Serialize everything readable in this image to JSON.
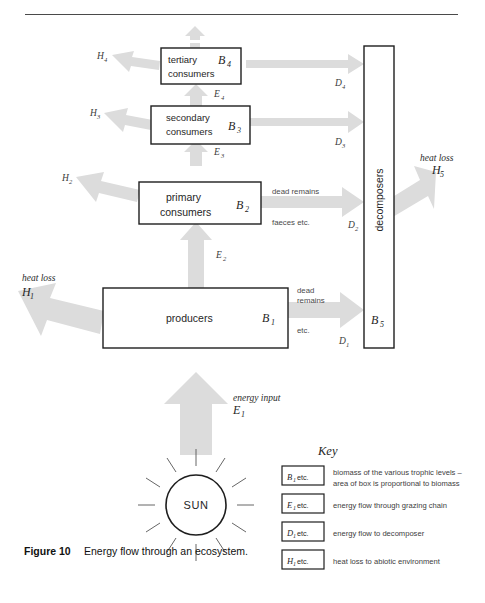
{
  "figure": {
    "caption_number": "Figure 10",
    "caption_text": "Energy flow through an ecosystem."
  },
  "trophic_levels": [
    {
      "id": "tertiary",
      "line1": "tertiary",
      "line2": "consumers",
      "biomass_symbol": "B",
      "biomass_sub": "4",
      "heat_loss_symbol": "H",
      "heat_loss_sub": "4",
      "energy_in_symbol": "E",
      "energy_in_sub": "4",
      "decomposer_symbol": "D",
      "decomposer_sub": "4"
    },
    {
      "id": "secondary",
      "line1": "secondary",
      "line2": "consumers",
      "biomass_symbol": "B",
      "biomass_sub": "3",
      "heat_loss_symbol": "H",
      "heat_loss_sub": "3",
      "energy_in_symbol": "E",
      "energy_in_sub": "3",
      "decomposer_symbol": "D",
      "decomposer_sub": "3"
    },
    {
      "id": "primary",
      "line1": "primary",
      "line2": "consumers",
      "biomass_symbol": "B",
      "biomass_sub": "2",
      "heat_loss_symbol": "H",
      "heat_loss_sub": "2",
      "energy_in_symbol": "E",
      "energy_in_sub": "2",
      "decomposer_symbol": "D",
      "decomposer_sub": "2",
      "transfer_note_1": "dead remains",
      "transfer_note_2": "faeces etc."
    },
    {
      "id": "producers",
      "line1": "producers",
      "line2": "",
      "biomass_symbol": "B",
      "biomass_sub": "1",
      "heat_loss_label": "heat loss",
      "heat_loss_symbol": "H",
      "heat_loss_sub": "1",
      "energy_in_symbol": "E",
      "energy_in_sub": "1",
      "decomposer_symbol": "D",
      "decomposer_sub": "1",
      "transfer_note_1": "dead",
      "transfer_note_2": "remains",
      "transfer_note_3": "etc."
    }
  ],
  "decomposers": {
    "label": "decomposers",
    "biomass_symbol": "B",
    "biomass_sub": "5",
    "heat_loss_label": "heat loss",
    "heat_loss_symbol": "H",
    "heat_loss_sub": "5"
  },
  "sun": {
    "label": "SUN",
    "energy_input_label": "energy input",
    "energy_input_symbol": "E",
    "energy_input_sub": "1"
  },
  "key": {
    "title": "Key",
    "entries": [
      {
        "symbol": "B",
        "sub": "1",
        "etc": " etc.",
        "desc_line1": "biomass of the various trophic levels –",
        "desc_line2": "area of box is proportional to biomass"
      },
      {
        "symbol": "E",
        "sub": "1",
        "etc": " etc.",
        "desc_line1": "energy flow through grazing chain",
        "desc_line2": ""
      },
      {
        "symbol": "D",
        "sub": "1",
        "etc": " etc.",
        "desc_line1": "energy flow to decomposer",
        "desc_line2": ""
      },
      {
        "symbol": "H",
        "sub": "1",
        "etc": " etc.",
        "desc_line1": "heat loss to abiotic environment",
        "desc_line2": ""
      }
    ]
  },
  "colors": {
    "arrow": "#dcdcdc",
    "box_stroke": "#1e1e1e",
    "text": "#262626",
    "rule": "#4a4a4a"
  }
}
